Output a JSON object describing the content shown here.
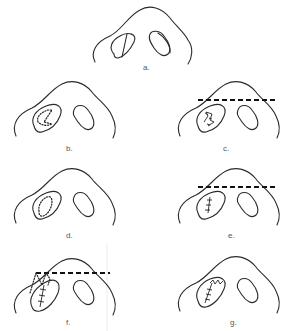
{
  "figure": {
    "panels": [
      {
        "id": "a",
        "label": "a.",
        "description": "Nasal base with bilateral nostrils; left nostril divided by a line"
      },
      {
        "id": "b",
        "label": "b.",
        "description": "Dotted Z-shaped incision within left nostril"
      },
      {
        "id": "c",
        "label": "c.",
        "description": "Zig-zag sutured left nostril with dashed transverse line across nasal tip"
      },
      {
        "id": "d",
        "label": "d.",
        "description": "Dotted oval excision outline within left nostril"
      },
      {
        "id": "e",
        "label": "e.",
        "description": "Straight sutured closure in left nostril with dashed transverse line"
      },
      {
        "id": "f",
        "label": "f.",
        "description": "Dotted triangular flap from dashed line into left nostril with suture"
      },
      {
        "id": "g",
        "label": "g.",
        "description": "Zig-zag and straight suture closure in left nostril"
      }
    ]
  },
  "colors": {
    "line": "#2a2a2a",
    "label": "#555555",
    "background": "#ffffff"
  }
}
